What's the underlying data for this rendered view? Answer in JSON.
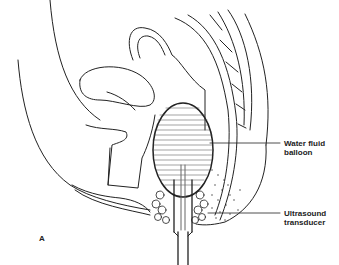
{
  "figure": {
    "panel_label": "A",
    "labels": [
      {
        "id": "balloon",
        "line1": "Water fluid",
        "line2": "balloon"
      },
      {
        "id": "transducer",
        "line1": "Ultrasound",
        "line2": "transducer"
      }
    ]
  }
}
